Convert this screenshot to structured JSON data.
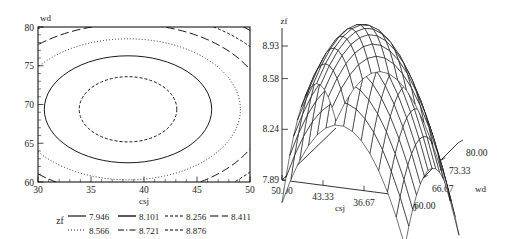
{
  "figure": {
    "panels": [
      "contour-plot",
      "surface-plot"
    ]
  },
  "contour": {
    "y_axis_title": "wd",
    "x_axis_title": "csj",
    "x_ticks": [
      "30",
      "35",
      "40",
      "45",
      "50"
    ],
    "y_ticks": [
      "60",
      "65",
      "70",
      "75",
      "80"
    ],
    "x_range": [
      30,
      50
    ],
    "y_range": [
      60,
      80
    ]
  },
  "legend": {
    "title": "zf",
    "entries": [
      {
        "label": "7.946",
        "style": "solid"
      },
      {
        "label": "8.101",
        "style": "solid"
      },
      {
        "label": "8.256",
        "style": "shortdash"
      },
      {
        "label": "8.411",
        "style": "longdash"
      },
      {
        "label": "8.566",
        "style": "dot"
      },
      {
        "label": "8.721",
        "style": "dashdot"
      },
      {
        "label": "8.876",
        "style": "shortdash"
      }
    ]
  },
  "surface": {
    "z_axis_title": "zf",
    "z_ticks": [
      "7.89",
      "8.24",
      "8.58",
      "8.93"
    ],
    "x_axis_title": "csj",
    "x_ticks": [
      "50.00",
      "43.33",
      "36.67",
      "30.00"
    ],
    "y_axis_title": "wd",
    "y_ticks": [
      "60.00",
      "66.67",
      "73.33",
      "80.00"
    ]
  },
  "chart_data": [
    {
      "type": "contour",
      "title": "",
      "xlabel": "csj",
      "ylabel": "wd",
      "zlabel": "zf",
      "xlim": [
        30,
        50
      ],
      "ylim": [
        60,
        80
      ],
      "xticks": [
        30,
        35,
        40,
        45,
        50
      ],
      "yticks": [
        60,
        65,
        70,
        75,
        80
      ],
      "grid": false,
      "legend_position": "below",
      "levels": [
        7.946,
        8.101,
        8.256,
        8.411,
        8.566,
        8.721,
        8.876
      ],
      "level_styles": [
        "solid",
        "solid",
        "shortdash",
        "longdash",
        "dot",
        "dashdot",
        "shortdash"
      ],
      "description": "Elliptical response-surface contours centered near csj=38.5, wd=69.5 with maximum zf above 8.876 at the center; contour ellipses widen outward, lowest levels appear only in the four corners of the design region.",
      "center": {
        "csj": 38.5,
        "wd": 69.5
      },
      "contours": [
        {
          "level": 8.876,
          "style": "shortdash",
          "semi_major_csj": 4.6,
          "semi_minor_wd": 4.2,
          "closed": true
        },
        {
          "level": 8.721,
          "style": "dashdot",
          "semi_major_csj": 7.9,
          "semi_minor_wd": 6.9,
          "closed": true
        },
        {
          "level": 8.566,
          "style": "dot",
          "semi_major_csj": 10.6,
          "semi_minor_wd": 9.1,
          "closed": true
        },
        {
          "level": 8.411,
          "style": "longdash",
          "semi_major_csj": 13.0,
          "semi_minor_wd": 11.0,
          "closed": false
        },
        {
          "level": 8.256,
          "style": "shortdash",
          "semi_major_csj": 15.0,
          "semi_minor_wd": 12.6,
          "closed": false
        },
        {
          "level": 8.101,
          "style": "solid",
          "semi_major_csj": 16.8,
          "semi_minor_wd": 14.0,
          "closed": false
        },
        {
          "level": 7.946,
          "style": "solid",
          "semi_major_csj": 18.4,
          "semi_minor_wd": 15.3,
          "closed": false
        }
      ]
    },
    {
      "type": "surface",
      "title": "",
      "xlabel": "csj",
      "ylabel": "wd",
      "zlabel": "zf",
      "xticks": [
        50.0,
        43.33,
        36.67,
        30.0
      ],
      "yticks": [
        60.0,
        66.67,
        73.33,
        80.0
      ],
      "zticks": [
        7.89,
        8.24,
        8.58,
        8.93
      ],
      "zlim": [
        7.89,
        8.93
      ],
      "grid": true,
      "legend_position": "none",
      "description": "Wireframe mesh of a downward-opening quadratic (dome) response surface in csj and wd; peak zf near 8.93 at the interior optimum, falling toward all edges of the csj x wd region.",
      "z_max": 8.93,
      "z_min": 7.89,
      "mesh_nx": 14,
      "mesh_ny": 14
    }
  ]
}
